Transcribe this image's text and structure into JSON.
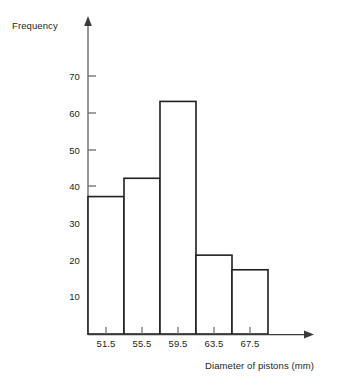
{
  "chart_data": {
    "type": "bar",
    "title": "",
    "subtitle": "",
    "xlabel": "Diameter of pistons (mm)",
    "ylabel": "Frequency",
    "categories": [
      "51.5",
      "55.5",
      "59.5",
      "63.5",
      "67.5"
    ],
    "values": [
      37,
      42,
      63,
      21,
      17
    ],
    "series": [
      {
        "name": "Frequency",
        "values": [
          37,
          42,
          63,
          21,
          17
        ]
      }
    ],
    "x_tick_labels": [
      "51.5",
      "55.5",
      "59.5",
      "63.5",
      "67.5"
    ],
    "y_tick_labels": [
      "10",
      "20",
      "30",
      "40",
      "50",
      "60",
      "70"
    ],
    "y_ticks": [
      10,
      20,
      30,
      40,
      50,
      60,
      70
    ],
    "ylim": [
      0,
      76
    ],
    "xlim_note": "bars contiguous, class width 4 mm, centers at tick labels",
    "grid": false,
    "legend": "none",
    "bar_fill": "#ffffff",
    "bar_stroke": "#231f20",
    "axis_color": "#3a3a3a",
    "background": "#ffffff",
    "axis_arrows": true
  },
  "geometry": {
    "axis_x": 88,
    "baseline_y": 334,
    "y_zero_value_y": 332,
    "y_unit_px": 3.66,
    "bar_width": 36,
    "y_axis_top": 17,
    "x_axis_right": 313
  }
}
